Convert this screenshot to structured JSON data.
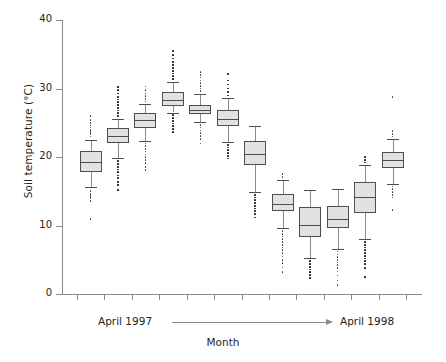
{
  "chart_data": {
    "type": "box",
    "title": "",
    "xlabel": "Month",
    "ylabel": "Soil temperature (°C)",
    "ylim": [
      0,
      40
    ],
    "yticks": [
      0,
      10,
      20,
      30,
      40
    ],
    "ytick_labels": [
      "0",
      "10",
      "20",
      "30",
      "40"
    ],
    "grid": false,
    "legend": null,
    "n_groups": 12,
    "x_axis_note_start": "April 1997",
    "x_axis_note_end": "April 1998",
    "categories": [
      "1",
      "2",
      "3",
      "4",
      "5",
      "6",
      "7",
      "8",
      "9",
      "10",
      "11",
      "12"
    ],
    "boxes": [
      {
        "label": "1",
        "q1": 17.8,
        "median": 19.3,
        "q3": 20.9,
        "whisker_low": 15.6,
        "whisker_high": 22.5,
        "outliers_high": [
          23.0,
          23.4,
          23.7,
          24.0,
          24.3,
          24.6,
          25.0,
          25.4,
          26.0
        ],
        "outliers_low": [
          15.0,
          14.6,
          14.3,
          14.0,
          13.6,
          11.0
        ]
      },
      {
        "label": "2",
        "q1": 22.1,
        "median": 23.0,
        "q3": 24.3,
        "whisker_low": 19.9,
        "whisker_high": 25.6,
        "outliers_high": [
          26.0,
          26.4,
          26.8,
          27.2,
          27.6,
          28.0,
          28.4,
          28.8,
          29.3,
          29.8,
          30.2
        ],
        "outliers_low": [
          19.4,
          19.0,
          18.6,
          18.2,
          17.8,
          17.3,
          16.9,
          16.4,
          15.9,
          15.2
        ]
      },
      {
        "label": "3",
        "q1": 24.2,
        "median": 25.4,
        "q3": 26.4,
        "whisker_low": 22.4,
        "whisker_high": 27.7,
        "outliers_high": [
          28.1,
          28.5,
          28.9,
          29.3,
          29.8,
          30.3
        ],
        "outliers_low": [
          22.0,
          21.6,
          21.2,
          20.8,
          20.4,
          20.0,
          19.6,
          19.1,
          18.6,
          18.1
        ]
      },
      {
        "label": "4",
        "q1": 27.4,
        "median": 28.4,
        "q3": 29.5,
        "whisker_low": 26.5,
        "whisker_high": 31.0,
        "outliers_high": [
          31.4,
          31.8,
          32.2,
          32.6,
          33.0,
          33.4,
          33.9,
          34.4,
          34.9,
          35.5
        ],
        "outliers_low": [
          26.1,
          25.7,
          25.3,
          24.9,
          24.5,
          24.1,
          23.7
        ]
      },
      {
        "label": "5",
        "q1": 26.2,
        "median": 26.9,
        "q3": 27.6,
        "whisker_low": 25.1,
        "whisker_high": 29.2,
        "outliers_high": [
          29.6,
          30.0,
          30.4,
          30.8,
          31.2,
          31.6,
          32.0,
          32.4
        ],
        "outliers_low": [
          24.7,
          24.3,
          23.9,
          23.5,
          23.1,
          22.6,
          22.0
        ]
      },
      {
        "label": "6",
        "q1": 24.5,
        "median": 25.6,
        "q3": 26.8,
        "whisker_low": 22.2,
        "whisker_high": 28.6,
        "outliers_high": [
          29.0,
          29.5,
          30.0,
          30.6,
          31.2,
          32.1
        ],
        "outliers_low": [
          21.8,
          21.4,
          21.0,
          20.6,
          20.2,
          19.8
        ]
      },
      {
        "label": "7",
        "q1": 18.8,
        "median": 20.5,
        "q3": 22.4,
        "whisker_low": 14.9,
        "whisker_high": 24.5,
        "outliers_high": [],
        "outliers_low": [
          14.5,
          14.1,
          13.7,
          13.3,
          12.9,
          12.5,
          12.1,
          11.7,
          11.2
        ]
      },
      {
        "label": "8",
        "q1": 12.1,
        "median": 13.2,
        "q3": 14.6,
        "whisker_low": 9.6,
        "whisker_high": 16.7,
        "outliers_high": [
          17.1,
          17.5
        ],
        "outliers_low": [
          9.2,
          8.8,
          8.4,
          8.0,
          7.6,
          7.2,
          6.8,
          6.4,
          6.0,
          5.5,
          5.0,
          4.5,
          3.9,
          3.2
        ]
      },
      {
        "label": "9",
        "q1": 8.3,
        "median": 10.1,
        "q3": 12.7,
        "whisker_low": 5.2,
        "whisker_high": 15.2,
        "outliers_high": [],
        "outliers_low": [
          4.8,
          4.4,
          4.0,
          3.6,
          3.2,
          2.8,
          2.4
        ]
      },
      {
        "label": "10",
        "q1": 9.6,
        "median": 11.0,
        "q3": 12.9,
        "whisker_low": 6.6,
        "whisker_high": 15.3,
        "outliers_high": [],
        "outliers_low": [
          6.2,
          5.8,
          5.4,
          5.0,
          4.6,
          4.2,
          3.8,
          3.3,
          2.7,
          2.0,
          1.3
        ]
      },
      {
        "label": "11",
        "q1": 11.8,
        "median": 14.2,
        "q3": 16.4,
        "whisker_low": 8.0,
        "whisker_high": 18.8,
        "outliers_high": [
          19.2,
          19.6,
          20.0
        ],
        "outliers_low": [
          7.6,
          7.2,
          6.8,
          6.4,
          6.0,
          5.6,
          5.2,
          4.8,
          4.4,
          3.8,
          2.5
        ]
      },
      {
        "label": "12",
        "q1": 18.4,
        "median": 19.6,
        "q3": 20.8,
        "whisker_low": 16.1,
        "whisker_high": 22.6,
        "outliers_high": [
          23.0,
          23.4,
          23.8,
          28.8
        ],
        "outliers_low": [
          15.7,
          15.3,
          14.9,
          14.5,
          14.1,
          12.3
        ]
      }
    ]
  }
}
